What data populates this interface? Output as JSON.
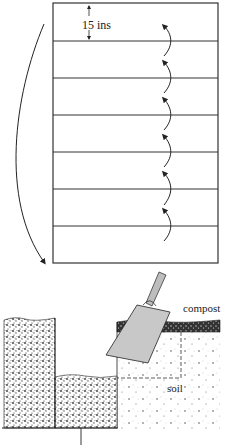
{
  "figure": {
    "plan": {
      "spacing_label": "15 ins",
      "strip_count": 7
    },
    "section": {
      "labels": {
        "compost": "compost",
        "soil": "soil"
      }
    }
  }
}
